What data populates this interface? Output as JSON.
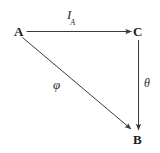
{
  "diagram": {
    "type": "commutative-triangle",
    "background_color": "#ffffff",
    "stroke_color": "#3a3a3a",
    "text_color": "#1d1d1d",
    "nodes": [
      {
        "id": "A",
        "label": "A",
        "x": 22,
        "y": 31
      },
      {
        "id": "C",
        "label": "C",
        "x": 139,
        "y": 31
      },
      {
        "id": "B",
        "label": "B",
        "x": 139,
        "y": 139
      }
    ],
    "edges": [
      {
        "id": "A-to-C",
        "from": "A",
        "to": "C",
        "label": "I",
        "label_subscript": "A",
        "orientation": "horizontal",
        "arrowhead": "end"
      },
      {
        "id": "C-to-B",
        "from": "C",
        "to": "B",
        "label": "θ",
        "orientation": "vertical",
        "arrowhead": "end"
      },
      {
        "id": "A-to-B",
        "from": "A",
        "to": "B",
        "label": "φ",
        "orientation": "diagonal",
        "arrowhead": "end"
      }
    ]
  }
}
